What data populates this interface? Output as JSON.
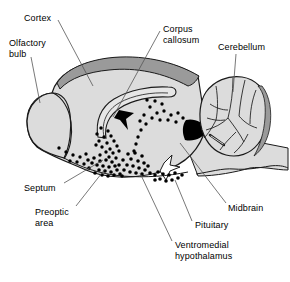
{
  "figure": {
    "type": "anatomical-diagram",
    "title": "",
    "style": "grayscale line drawing with stippled cell-distribution dots"
  },
  "colors": {
    "background": "#ffffff",
    "brain_fill": "#dcdcdc",
    "brain_fill_light": "#e3e3e3",
    "cortex_rim": "#9a9a9a",
    "outline": "#1a1a1a",
    "dot": "#000000",
    "leader_line": "#555555",
    "text": "#000000"
  },
  "labels": [
    {
      "id": "cortex",
      "text": "Cortex",
      "lines": [
        "Cortex"
      ],
      "x": 24,
      "y": 13,
      "align": "left"
    },
    {
      "id": "olfactory-bulb",
      "text": "Olfactory bulb",
      "lines": [
        "Olfactory",
        "bulb"
      ],
      "x": 9,
      "y": 38,
      "align": "left"
    },
    {
      "id": "corpus-callosum",
      "text": "Corpus callosum",
      "lines": [
        "Corpus",
        "callosum"
      ],
      "x": 163,
      "y": 24,
      "align": "left"
    },
    {
      "id": "cerebellum",
      "text": "Cerebellum",
      "lines": [
        "Cerebellum"
      ],
      "x": 218,
      "y": 42,
      "align": "left"
    },
    {
      "id": "septum",
      "text": "Septum",
      "lines": [
        "Septum"
      ],
      "x": 24,
      "y": 183,
      "align": "left"
    },
    {
      "id": "preoptic-area",
      "text": "Preoptic area",
      "lines": [
        "Preoptic",
        "area"
      ],
      "x": 35,
      "y": 207,
      "align": "left"
    },
    {
      "id": "ventromedial-hypothalamus",
      "text": "Ventromedial hypothalamus",
      "lines": [
        "Ventromedial",
        "hypothalamus"
      ],
      "x": 175,
      "y": 240,
      "align": "left"
    },
    {
      "id": "pituitary",
      "text": "Pituitary",
      "lines": [
        "Pituitary"
      ],
      "x": 195,
      "y": 220,
      "align": "left"
    },
    {
      "id": "midbrain",
      "text": "Midbrain",
      "lines": [
        "Midbrain"
      ],
      "x": 228,
      "y": 203,
      "align": "left"
    }
  ],
  "leader_lines": [
    {
      "id": "leader-cortex",
      "points": "58,20 93,86"
    },
    {
      "id": "leader-olfactory-bulb",
      "points": "31,57 40,103"
    },
    {
      "id": "leader-corpus-callosum",
      "points": "160,31 113,117"
    },
    {
      "id": "leader-cerebellum",
      "points": "236,54 233,92"
    },
    {
      "id": "leader-septum",
      "points": "64,186 103,160"
    },
    {
      "id": "leader-preoptic-area",
      "points": "76,208 105,169"
    },
    {
      "id": "leader-ventromedial-hypothalamus",
      "points": "172,243 140,173"
    },
    {
      "id": "leader-pituitary",
      "points": "192,223 175,180"
    },
    {
      "id": "leader-midbrain",
      "points": "226,205 180,143"
    }
  ],
  "dot_groups": [
    {
      "id": "septum-cluster",
      "region": "septum",
      "count": 18
    },
    {
      "id": "preoptic-cluster",
      "region": "preoptic area",
      "count": 34
    },
    {
      "id": "vmh-cluster",
      "region": "ventromedial hypothalamus",
      "count": 42
    },
    {
      "id": "midbrain-chain",
      "region": "midbrain",
      "count": 26
    },
    {
      "id": "ventral-row",
      "region": "ventral surface",
      "count": 12
    },
    {
      "id": "pituitary-cluster",
      "region": "pituitary",
      "count": 14
    }
  ]
}
